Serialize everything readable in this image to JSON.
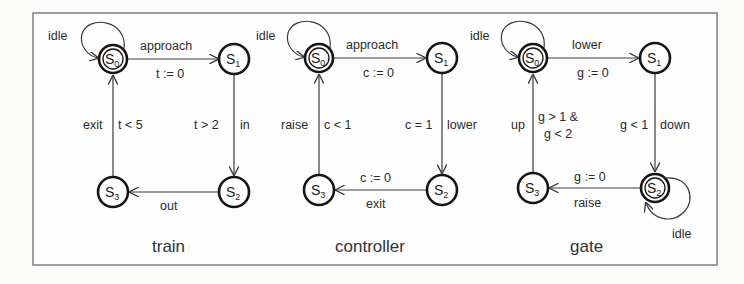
{
  "diagram": {
    "automata": [
      {
        "name": "train",
        "states": [
          {
            "id": "S",
            "sub": "0"
          },
          {
            "id": "S",
            "sub": "1"
          },
          {
            "id": "S",
            "sub": "2"
          },
          {
            "id": "S",
            "sub": "3"
          }
        ],
        "self_loop": {
          "state": "S0",
          "label": "idle"
        },
        "edges": [
          {
            "from": "S0",
            "to": "S1",
            "action": "approach",
            "guard_or_reset": "t := 0"
          },
          {
            "from": "S1",
            "to": "S2",
            "action": "in",
            "guard_or_reset": "t > 2"
          },
          {
            "from": "S2",
            "to": "S3",
            "action": "out",
            "guard_or_reset": ""
          },
          {
            "from": "S3",
            "to": "S0",
            "action": "exit",
            "guard_or_reset": "t < 5"
          }
        ]
      },
      {
        "name": "controller",
        "states": [
          {
            "id": "S",
            "sub": "0"
          },
          {
            "id": "S",
            "sub": "1"
          },
          {
            "id": "S",
            "sub": "2"
          },
          {
            "id": "S",
            "sub": "3"
          }
        ],
        "self_loop": {
          "state": "S0",
          "label": "idle"
        },
        "edges": [
          {
            "from": "S0",
            "to": "S1",
            "action": "approach",
            "guard_or_reset": "c := 0"
          },
          {
            "from": "S1",
            "to": "S2",
            "action": "lower",
            "guard_or_reset": "c = 1"
          },
          {
            "from": "S2",
            "to": "S3",
            "action": "exit",
            "guard_or_reset": "c := 0"
          },
          {
            "from": "S3",
            "to": "S0",
            "action": "raise",
            "guard_or_reset": "c < 1"
          }
        ]
      },
      {
        "name": "gate",
        "states": [
          {
            "id": "S",
            "sub": "0"
          },
          {
            "id": "S",
            "sub": "1"
          },
          {
            "id": "S",
            "sub": "2"
          },
          {
            "id": "S",
            "sub": "3"
          }
        ],
        "self_loops": [
          {
            "state": "S0",
            "label": "idle"
          },
          {
            "state": "S2",
            "label": "idle"
          }
        ],
        "edges": [
          {
            "from": "S0",
            "to": "S1",
            "action": "lower",
            "guard_or_reset": "g := 0"
          },
          {
            "from": "S1",
            "to": "S2",
            "action": "down",
            "guard_or_reset": "g < 1"
          },
          {
            "from": "S2",
            "to": "S3",
            "action": "raise",
            "guard_or_reset": "g := 0"
          },
          {
            "from": "S3",
            "to": "S0",
            "action": "up",
            "guard_or_reset_line1": "g > 1 &",
            "guard_or_reset_line2": "g < 2"
          }
        ]
      }
    ]
  }
}
